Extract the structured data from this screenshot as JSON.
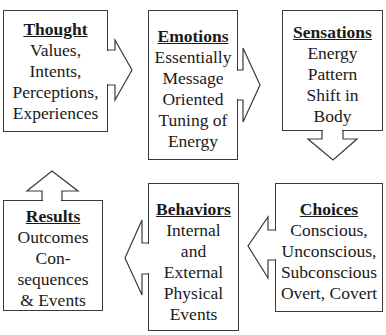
{
  "diagram": {
    "boxes": [
      {
        "id": "thought",
        "title": "Thought",
        "lines": [
          "Values,",
          "Intents,",
          "Perceptions,",
          "Experiences"
        ]
      },
      {
        "id": "emotions",
        "title": "Emotions",
        "lines": [
          "Essentially",
          "Message",
          "Oriented",
          "Tuning of",
          "Energy"
        ]
      },
      {
        "id": "sensations",
        "title": "Sensations",
        "lines": [
          "Energy",
          "Pattern",
          "Shift in",
          "Body"
        ]
      },
      {
        "id": "choices",
        "title": "Choices",
        "lines": [
          "Conscious,",
          "Unconscious,",
          "Subconscious",
          "Overt, Covert"
        ]
      },
      {
        "id": "behaviors",
        "title": "Behaviors",
        "lines": [
          "Internal",
          "and",
          "External",
          "Physical",
          "Events"
        ]
      },
      {
        "id": "results",
        "title": "Results",
        "lines": [
          "Outcomes",
          "Con-",
          "sequences",
          "& Events"
        ]
      }
    ],
    "arrows": [
      {
        "from": "thought",
        "to": "emotions",
        "direction": "right"
      },
      {
        "from": "emotions",
        "to": "sensations",
        "direction": "right"
      },
      {
        "from": "sensations",
        "to": "choices",
        "direction": "down"
      },
      {
        "from": "choices",
        "to": "behaviors",
        "direction": "left"
      },
      {
        "from": "behaviors",
        "to": "results",
        "direction": "left"
      },
      {
        "from": "results",
        "to": "thought",
        "direction": "up"
      }
    ]
  }
}
